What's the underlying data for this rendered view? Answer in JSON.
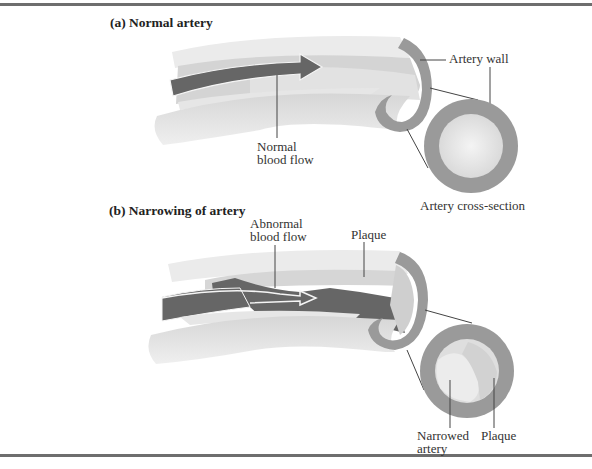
{
  "figure": {
    "panel_a": {
      "title": "(a) Normal artery",
      "labels": {
        "artery_wall": "Artery wall",
        "normal_flow_line1": "Normal",
        "normal_flow_line2": "blood flow",
        "cross_section": "Artery cross-section"
      }
    },
    "panel_b": {
      "title": "(b) Narrowing of artery",
      "labels": {
        "abnormal_flow_line1": "Abnormal",
        "abnormal_flow_line2": "blood flow",
        "plaque_top": "Plaque",
        "narrowed_line1": "Narrowed",
        "narrowed_line2": "artery",
        "plaque_bottom": "Plaque"
      }
    },
    "colors": {
      "wall": "#9a9a9a",
      "tube_light": "#e6e6e6",
      "tube_mid": "#cfcfcf",
      "blood": "#666666",
      "rule": "#6e6e6e"
    }
  }
}
